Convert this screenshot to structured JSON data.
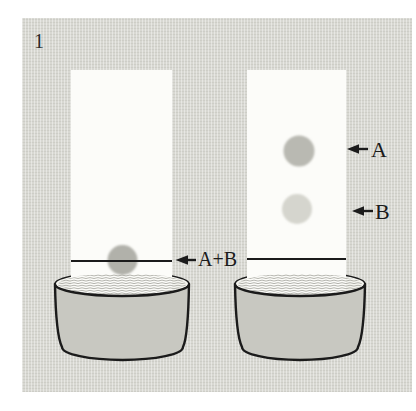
{
  "figure": {
    "number": "1"
  },
  "labels": {
    "combined": "A+B",
    "a": "A",
    "b": "B"
  },
  "icons": {
    "combined_arrow": "left-arrow",
    "a_arrow": "left-arrow",
    "b_arrow": "left-arrow"
  },
  "colors": {
    "page_bg": "#ffffff",
    "panel_bg": "#d8d8d2",
    "strip": "#fcfcf9",
    "liquid_surface": "#f4f4ef",
    "wave": "#a2a29b",
    "dish_wall": "#c8c8c1",
    "ink": "#1b1b1b",
    "spot_combined": "#b1b1aa",
    "spot_a": "#b9b9b2",
    "spot_b": "#d5d5ce"
  }
}
